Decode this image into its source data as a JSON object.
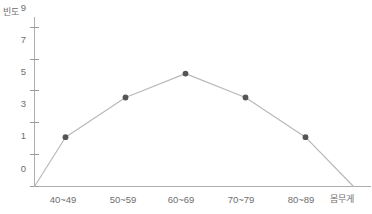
{
  "chart_data": {
    "type": "line",
    "title": "",
    "xlabel": "몸무게",
    "ylabel": "빈도",
    "categories": [
      "40~49",
      "50~59",
      "60~69",
      "70~79",
      "80~89"
    ],
    "values": [
      3.1,
      5.6,
      7.1,
      5.6,
      3.1
    ],
    "series": [
      {
        "name": "빈도",
        "values": [
          3.1,
          5.6,
          7.1,
          5.6,
          3.1
        ]
      }
    ],
    "ylim": [
      0,
      10
    ],
    "xlim": [
      0,
      7
    ],
    "ytick_labels": [
      "0",
      "1",
      "3",
      "5",
      "7",
      "9"
    ],
    "ytick_values": [
      0,
      1,
      3,
      5,
      7,
      9
    ],
    "grid": false,
    "legend": "none",
    "markers": "filled-circle",
    "line_color": "#b9b9b9",
    "marker_color": "#555555",
    "axis_color": "#aeaeae",
    "text_color": "#6e6e6e",
    "baseline_start": {
      "x_index": 0,
      "value": 0
    },
    "baseline_end": {
      "x_index": 6,
      "value": 0
    }
  },
  "axes": {
    "y_title": "빈도",
    "x_title": "몸무게"
  }
}
